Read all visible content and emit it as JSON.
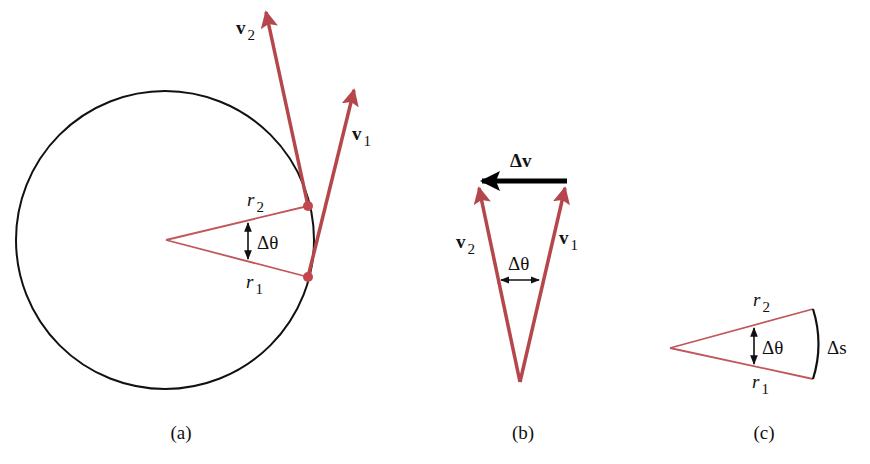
{
  "colors": {
    "vector": "#b4464c",
    "radius": "#c0575c",
    "dot": "#c2464c",
    "circle": "#111111",
    "delta_v": "#000000"
  },
  "panel_a": {
    "caption": "(a)",
    "v1_label": "v",
    "v1_sub": "1",
    "v2_label": "v",
    "v2_sub": "2",
    "r1_label": "r",
    "r1_sub": "1",
    "r2_label": "r",
    "r2_sub": "2",
    "angle_label": "Δθ"
  },
  "panel_b": {
    "caption": "(b)",
    "delta_v_label": "Δv",
    "v1_label": "v",
    "v1_sub": "1",
    "v2_label": "v",
    "v2_sub": "2",
    "angle_label": "Δθ"
  },
  "panel_c": {
    "caption": "(c)",
    "r1_label": "r",
    "r1_sub": "1",
    "r2_label": "r",
    "r2_sub": "2",
    "angle_label": "Δθ",
    "arc_label": "Δs"
  }
}
